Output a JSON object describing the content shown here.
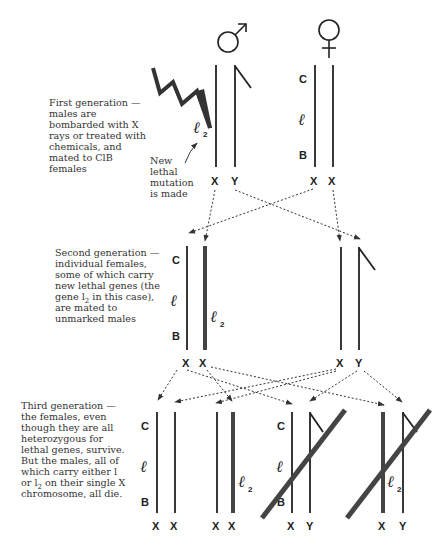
{
  "symbols": {
    "male": "male-symbol",
    "female": "female-symbol"
  },
  "captions": {
    "first_generation": "First generation — males are bombarded with X rays or treated with chemicals, and mated to ClB females",
    "new_mutation": "New lethal mutation is made",
    "second_generation_pre": "Second generation — individual females, some of which carry new lethal genes (the gene l",
    "second_generation_sub": "2",
    "second_generation_post": " in this case), are mated to unmarked males",
    "third_generation_pre": "Third generation — the females, even though they are all heterozygous for lethal genes, survive.  But the males, all of which carry either l or l",
    "third_generation_sub": "2",
    "third_generation_post": " on their single X chromosome, all die."
  },
  "markers": {
    "C": "C",
    "l": "ℓ",
    "B": "B",
    "l2_main": "ℓ",
    "l2_sub": "2"
  },
  "chromosome_labels": {
    "X": "X",
    "Y": "Y"
  },
  "generations": [
    {
      "name": "first",
      "individuals": [
        {
          "sex": "male",
          "chromosomes": [
            "X",
            "Y"
          ],
          "irradiated": true,
          "new_mutation": "l2"
        },
        {
          "sex": "female",
          "chromosomes": [
            "X",
            "X"
          ],
          "markers": [
            "C",
            "l",
            "B"
          ]
        }
      ]
    },
    {
      "name": "second",
      "individuals": [
        {
          "sex": "female",
          "chromosomes": [
            "X",
            "X"
          ],
          "markers": [
            "C",
            "l",
            "B",
            "l2"
          ]
        },
        {
          "sex": "male",
          "chromosomes": [
            "X",
            "Y"
          ]
        }
      ]
    },
    {
      "name": "third",
      "individuals": [
        {
          "sex": "female",
          "chromosomes": [
            "X",
            "X"
          ],
          "markers": [
            "C",
            "l",
            "B"
          ],
          "survives": true
        },
        {
          "sex": "female",
          "chromosomes": [
            "X",
            "X"
          ],
          "markers": [
            "l2"
          ],
          "survives": true
        },
        {
          "sex": "male",
          "chromosomes": [
            "X",
            "Y"
          ],
          "markers": [
            "C",
            "l",
            "B"
          ],
          "survives": false
        },
        {
          "sex": "male",
          "chromosomes": [
            "X",
            "Y"
          ],
          "markers": [
            "l2"
          ],
          "survives": false
        }
      ]
    }
  ],
  "colors": {
    "ink": "#222222",
    "mutant_chromosome": "#444444",
    "text": "#333333",
    "background": "#ffffff"
  }
}
